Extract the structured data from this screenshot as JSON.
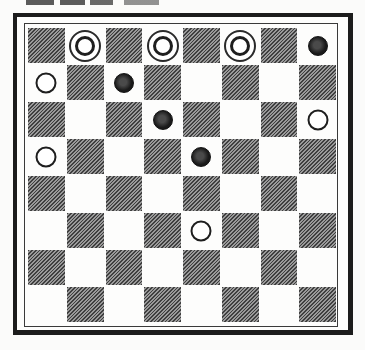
{
  "board": {
    "size": 8,
    "dark_square_parity": "even",
    "colors": {
      "light": "#ffffff",
      "dark_hatch": "#6f6f6f",
      "frame": "#1c1c1c"
    },
    "pieces": [
      {
        "row": 0,
        "col": 1,
        "type": "white-king"
      },
      {
        "row": 0,
        "col": 3,
        "type": "white-king"
      },
      {
        "row": 0,
        "col": 5,
        "type": "white-king"
      },
      {
        "row": 0,
        "col": 7,
        "type": "black-man"
      },
      {
        "row": 1,
        "col": 0,
        "type": "white-man"
      },
      {
        "row": 1,
        "col": 2,
        "type": "black-man"
      },
      {
        "row": 2,
        "col": 3,
        "type": "black-man"
      },
      {
        "row": 2,
        "col": 7,
        "type": "white-man"
      },
      {
        "row": 3,
        "col": 0,
        "type": "white-man"
      },
      {
        "row": 3,
        "col": 4,
        "type": "black-man"
      },
      {
        "row": 5,
        "col": 4,
        "type": "white-man"
      }
    ]
  }
}
